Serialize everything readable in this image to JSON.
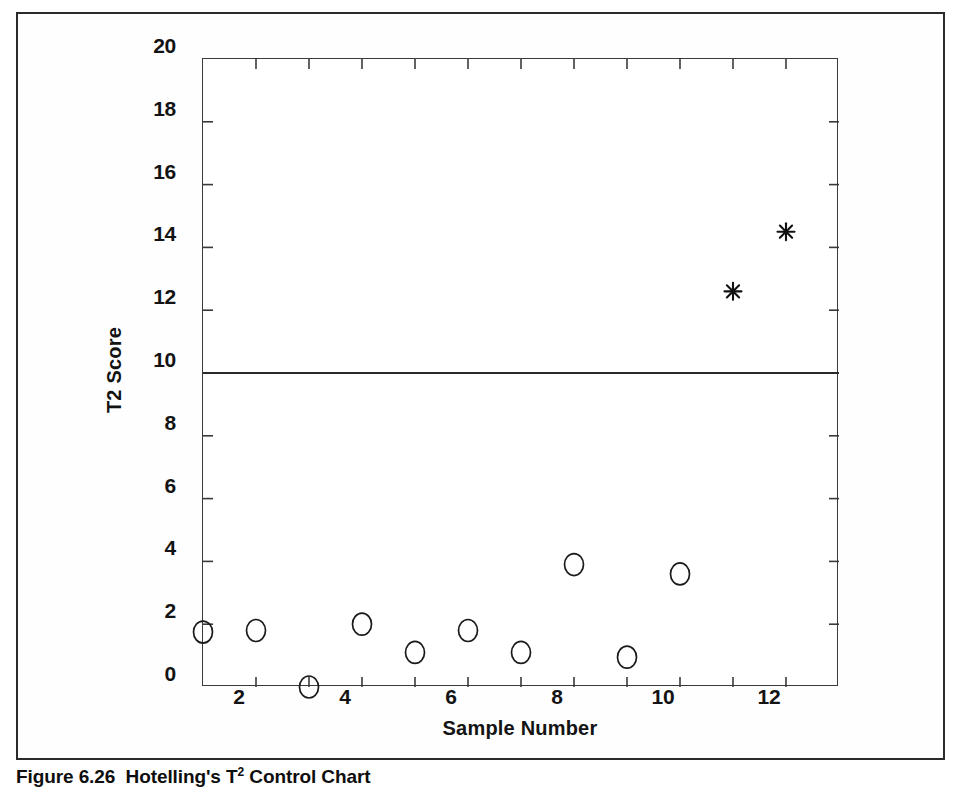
{
  "figure": {
    "caption_prefix": "Figure 6.26",
    "caption_text": "Hotelling's T",
    "caption_superscript": "2",
    "caption_suffix": " Control Chart",
    "caption_full": "Figure 6.26  Hotelling's T2 Control Chart"
  },
  "chart_data": {
    "type": "scatter",
    "title": "",
    "xlabel": "Sample Number",
    "ylabel": "T2 Score",
    "xlim": [
      1,
      13
    ],
    "ylim": [
      0,
      20
    ],
    "grid": false,
    "legend_position": "none",
    "x_ticks": [
      1,
      2,
      3,
      4,
      5,
      6,
      7,
      8,
      9,
      10,
      11,
      12,
      13
    ],
    "x_tick_labels": [
      "",
      "2",
      "",
      "4",
      "",
      "6",
      "",
      "8",
      "",
      "10",
      "",
      "12",
      ""
    ],
    "y_ticks": [
      0,
      2,
      4,
      6,
      8,
      10,
      12,
      14,
      16,
      18,
      20
    ],
    "y_tick_labels": [
      "0",
      "2",
      "4",
      "6",
      "8",
      "10",
      "12",
      "14",
      "16",
      "18",
      "20"
    ],
    "x": [
      1,
      2,
      3,
      4,
      5,
      6,
      7,
      8,
      9,
      10,
      11,
      12
    ],
    "values": [
      1.75,
      1.8,
      0.0,
      2.0,
      1.1,
      1.8,
      1.1,
      3.9,
      0.95,
      3.6,
      12.6,
      14.5
    ],
    "series": [
      {
        "name": "In control",
        "marker": "circle-open",
        "color": "#1a1a1a",
        "points": [
          {
            "x": 1,
            "y": 1.75
          },
          {
            "x": 2,
            "y": 1.8
          },
          {
            "x": 3,
            "y": 0.0
          },
          {
            "x": 4,
            "y": 2.0
          },
          {
            "x": 5,
            "y": 1.1
          },
          {
            "x": 6,
            "y": 1.8
          },
          {
            "x": 7,
            "y": 1.1
          },
          {
            "x": 8,
            "y": 3.9
          },
          {
            "x": 9,
            "y": 0.95
          },
          {
            "x": 10,
            "y": 3.6
          }
        ]
      },
      {
        "name": "Out of control",
        "marker": "asterisk",
        "color": "#111111",
        "points": [
          {
            "x": 11,
            "y": 12.6
          },
          {
            "x": 12,
            "y": 14.5
          }
        ]
      }
    ],
    "control_limits": [
      {
        "name": "T2 UCL",
        "label": "T2 UCL",
        "value": 10.0,
        "color": "#2a2a2a"
      }
    ],
    "annotations": [
      {
        "text": "T2 UCL",
        "x": 2.9,
        "y": 10.75
      }
    ]
  },
  "colors": {
    "frame": "#2b2b2b",
    "axis": "#3a3a3a",
    "marker": "#1a1a1a",
    "limit_line": "#2a2a2a",
    "text": "#131313",
    "background": "#ffffff"
  }
}
